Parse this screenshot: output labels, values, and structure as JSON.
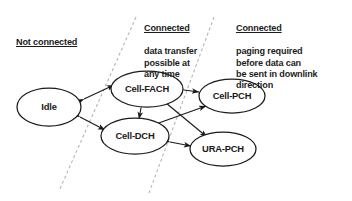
{
  "diagram": {
    "background_color": "#ffffff",
    "stroke_color": "#1b1b1b",
    "divider_color": "#b4b4b4",
    "regions": [
      {
        "id": "not-connected",
        "heading": "Not connected",
        "body": ""
      },
      {
        "id": "connected-data-transfer",
        "heading": "Connected",
        "body": "data transfer\npossible at\nany time"
      },
      {
        "id": "connected-paging",
        "heading": "Connected",
        "body": "paging required\nbefore data can\nbe sent in downlink\ndirection"
      }
    ],
    "nodes": [
      {
        "id": "idle",
        "label": "Idle",
        "cx": 49,
        "cy": 107,
        "rx": 32,
        "ry": 19
      },
      {
        "id": "cell-fach",
        "label": "Cell-FACH",
        "cx": 147,
        "cy": 89,
        "rx": 36,
        "ry": 18
      },
      {
        "id": "cell-pch",
        "label": "Cell-PCH",
        "cx": 232,
        "cy": 96,
        "rx": 33,
        "ry": 17
      },
      {
        "id": "cell-dch",
        "label": "Cell-DCH",
        "cx": 135,
        "cy": 136,
        "rx": 34,
        "ry": 18
      },
      {
        "id": "ura-pch",
        "label": "URA-PCH",
        "cx": 223,
        "cy": 149,
        "rx": 33,
        "ry": 17
      }
    ],
    "edges": [
      {
        "id": "idle-cell-fach",
        "from": "idle",
        "to": "cell-fach",
        "direction": "both"
      },
      {
        "id": "idle-cell-dch",
        "from": "idle",
        "to": "cell-dch",
        "direction": "both"
      },
      {
        "id": "fach-dch",
        "from": "cell-fach",
        "to": "cell-dch",
        "direction": "both"
      },
      {
        "id": "fach-pch",
        "from": "cell-fach",
        "to": "cell-pch",
        "direction": "both"
      },
      {
        "id": "fach-ura",
        "from": "cell-fach",
        "to": "ura-pch",
        "direction": "both"
      },
      {
        "id": "dch-pch",
        "from": "cell-dch",
        "to": "cell-pch",
        "direction": "both"
      },
      {
        "id": "dch-ura",
        "from": "cell-dch",
        "to": "ura-pch",
        "direction": "both"
      }
    ],
    "dividers": [
      {
        "id": "divider-left",
        "x1": 136,
        "y1": 17,
        "x2": 59,
        "y2": 191
      },
      {
        "id": "divider-right",
        "x1": 214,
        "y1": 17,
        "x2": 149,
        "y2": 193
      }
    ]
  }
}
